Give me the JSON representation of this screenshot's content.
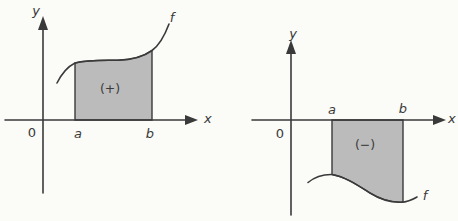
{
  "figure": {
    "description_labels": {
      "left_diagram": {
        "y_axis_label": "y",
        "x_axis_label": "x",
        "origin_label": "0",
        "lower_bound_label": "a",
        "upper_bound_label": "b",
        "function_label": "f",
        "region_sign_label": "(+)"
      },
      "right_diagram": {
        "y_axis_label": "y",
        "x_axis_label": "x",
        "origin_label": "0",
        "lower_bound_label": "a",
        "upper_bound_label": "b",
        "function_label": "f",
        "region_sign_label": "(−)"
      }
    },
    "colors": {
      "shaded_region": "#bbbbbb",
      "line": "#3a3a3a",
      "background": "#fbfbf8"
    }
  }
}
